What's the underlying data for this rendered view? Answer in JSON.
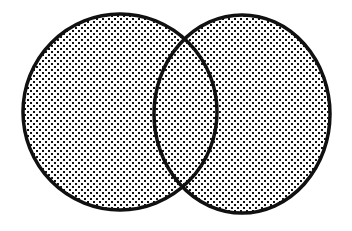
{
  "diagram": {
    "type": "venn",
    "sets": [
      {
        "id": "left",
        "cx": 120,
        "cy": 112,
        "rx": 97,
        "ry": 98
      },
      {
        "id": "right",
        "cx": 242,
        "cy": 114,
        "rx": 88,
        "ry": 99
      }
    ],
    "colors": {
      "background": "#ffffff",
      "stroke": "#111111",
      "dot": "#111111"
    },
    "stroke_width": 3.5,
    "fill_pattern": "stipple-dots"
  }
}
